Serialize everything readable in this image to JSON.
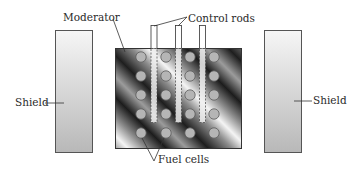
{
  "labels": {
    "moderator": "Moderator",
    "control_rods": "Control rods",
    "shield_left": "Shield",
    "shield_right": "Shield",
    "fuel_cells": "Fuel cells"
  },
  "colors": {
    "shield_light": "#f2f2f2",
    "shield_dark": "#b9b9b9",
    "outline": "#555555",
    "fuel_cell": "#b5b5b5",
    "text": "#2a2a2a"
  },
  "fuel_grid": {
    "columns": 4,
    "rows": 5
  },
  "control_rod_count": 3
}
